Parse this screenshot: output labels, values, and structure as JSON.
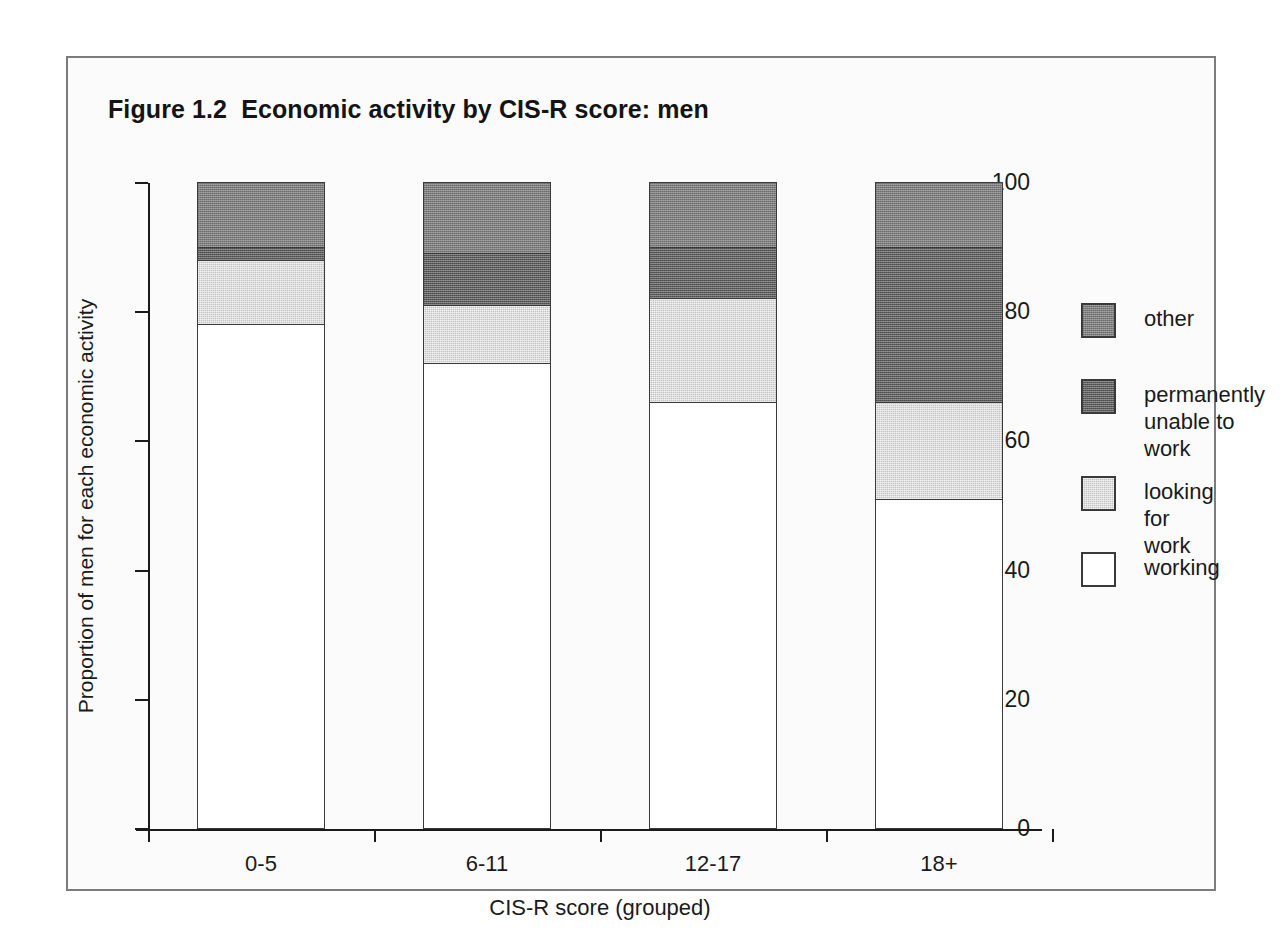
{
  "figure": {
    "title": "Figure 1.2  Economic activity by CIS-R score: men"
  },
  "chart_data": {
    "type": "bar",
    "subtype": "stacked-bar-100",
    "title": "Figure 1.2  Economic activity by CIS-R score: men",
    "xlabel": "CIS-R score (grouped)",
    "ylabel": "Proportion of men for each economic activity",
    "categories": [
      "0-5",
      "6-11",
      "12-17",
      "18+"
    ],
    "ylim": [
      0,
      100
    ],
    "yticks": [
      0,
      20,
      40,
      60,
      80,
      100
    ],
    "ytick_labels": [
      "0",
      "20",
      "40",
      "60",
      "80",
      "100"
    ],
    "grid": false,
    "legend_position": "right",
    "series": [
      {
        "name": "working",
        "color": "#ffffff",
        "values": [
          78,
          72,
          66,
          51
        ]
      },
      {
        "name": "looking for work",
        "color": "#c3c3c3",
        "values": [
          10,
          9,
          16,
          15
        ]
      },
      {
        "name": "permanently unable to work",
        "color": "#5e5e5e",
        "values": [
          2,
          8,
          8,
          24
        ]
      },
      {
        "name": "other",
        "color": "#7d7d7d",
        "values": [
          10,
          11,
          10,
          10
        ]
      }
    ],
    "cumulative_tops": {
      "working": [
        78,
        72,
        66,
        51
      ],
      "looking for work": [
        88,
        81,
        82,
        66
      ],
      "permanently unable to work": [
        90,
        89,
        90,
        90
      ],
      "other": [
        100,
        100,
        100,
        100
      ]
    }
  },
  "legend": {
    "items": [
      {
        "label": "other",
        "series": "other"
      },
      {
        "label": "permanently\nunable to work",
        "series": "permanently unable to work"
      },
      {
        "label": "looking for\nwork",
        "series": "looking for work"
      },
      {
        "label": "working",
        "series": "working"
      }
    ]
  }
}
